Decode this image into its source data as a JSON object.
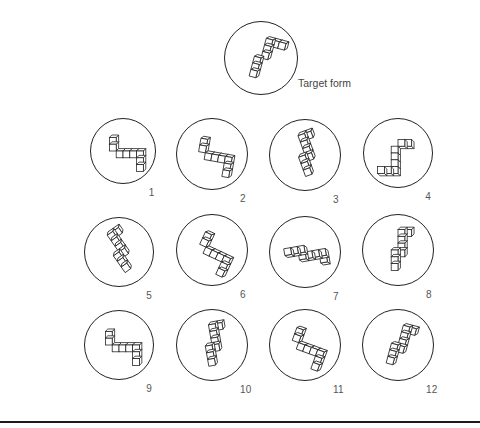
{
  "figure": {
    "target": {
      "label": "Target form",
      "cx": 261,
      "cy": 58,
      "r": 37
    },
    "options": [
      {
        "number": "1",
        "cx": 123,
        "cy": 151,
        "r": 33
      },
      {
        "number": "2",
        "cx": 212,
        "cy": 154,
        "r": 36
      },
      {
        "number": "3",
        "cx": 305,
        "cy": 155,
        "r": 36
      },
      {
        "number": "4",
        "cx": 398,
        "cy": 153,
        "r": 35
      },
      {
        "number": "5",
        "cx": 119,
        "cy": 252,
        "r": 35
      },
      {
        "number": "6",
        "cx": 212,
        "cy": 250,
        "r": 36
      },
      {
        "number": "7",
        "cx": 305,
        "cy": 252,
        "r": 36
      },
      {
        "number": "8",
        "cx": 398,
        "cy": 250,
        "r": 36
      },
      {
        "number": "9",
        "cx": 119,
        "cy": 345,
        "r": 35
      },
      {
        "number": "10",
        "cx": 212,
        "cy": 345,
        "r": 36
      },
      {
        "number": "11",
        "cx": 305,
        "cy": 345,
        "r": 36
      },
      {
        "number": "12",
        "cx": 398,
        "cy": 345,
        "r": 36
      }
    ]
  },
  "colors": {
    "stroke": "#222222",
    "label": "#555555",
    "rule": "#1a1a1a"
  }
}
